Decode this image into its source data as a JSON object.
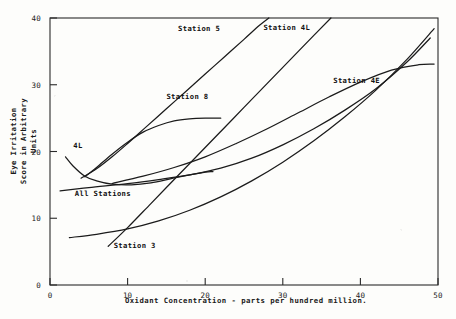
{
  "chart_data": {
    "type": "line",
    "title": "",
    "xlabel": "Oxidant Concentration - parts per hundred million.",
    "ylabel_line1": "Eye Irritation",
    "ylabel_line2": "Score in Arbitrary Units",
    "xlim": [
      0,
      50
    ],
    "ylim": [
      0,
      40
    ],
    "xticks": [
      0,
      10,
      20,
      30,
      40,
      50
    ],
    "yticks": [
      0,
      10,
      20,
      30,
      40
    ],
    "xtick_labels": [
      "0",
      "10",
      "20",
      "30",
      "40",
      "50"
    ],
    "ytick_labels": [
      "0",
      "10",
      "20",
      "30",
      "40"
    ],
    "grid": false,
    "legend": "inline-curve-labels",
    "series": [
      {
        "name": "4L",
        "label": "4L",
        "label_x": 3.0,
        "label_y": 20.5,
        "points": [
          [
            2.0,
            19.2
          ],
          [
            3.0,
            17.8
          ],
          [
            4.5,
            16.3
          ],
          [
            6.0,
            15.6
          ],
          [
            8.0,
            15.1
          ],
          [
            10.5,
            15.0
          ],
          [
            13.0,
            15.3
          ],
          [
            15.5,
            15.9
          ],
          [
            17.5,
            16.4
          ],
          [
            19.5,
            16.8
          ],
          [
            21.0,
            17.0
          ]
        ]
      },
      {
        "name": "All Stations",
        "label": "All Stations",
        "label_x": 3.2,
        "label_y": 13.4,
        "points": [
          [
            1.3,
            14.1
          ],
          [
            5.0,
            14.6
          ],
          [
            10.0,
            15.2
          ],
          [
            14.0,
            15.8
          ],
          [
            18.0,
            16.5
          ],
          [
            22.0,
            17.5
          ],
          [
            26.0,
            19.0
          ],
          [
            30.0,
            21.0
          ],
          [
            34.0,
            23.4
          ],
          [
            38.0,
            26.2
          ],
          [
            42.0,
            29.4
          ],
          [
            46.0,
            33.4
          ],
          [
            49.0,
            37.0
          ]
        ]
      },
      {
        "name": "Station 5",
        "label": "Station 5",
        "label_x": 16.5,
        "label_y": 38.0,
        "points": [
          [
            4.0,
            16.0
          ],
          [
            6.0,
            17.4
          ],
          [
            8.0,
            19.2
          ],
          [
            10.0,
            21.2
          ],
          [
            12.5,
            23.8
          ],
          [
            15.0,
            26.4
          ],
          [
            17.5,
            29.0
          ],
          [
            20.0,
            31.6
          ],
          [
            22.5,
            34.2
          ],
          [
            25.0,
            36.8
          ],
          [
            27.0,
            38.9
          ],
          [
            28.2,
            40.0
          ]
        ]
      },
      {
        "name": "Station 8",
        "label": "Station 8",
        "label_x": 15.0,
        "label_y": 27.8,
        "points": [
          [
            4.5,
            16.2
          ],
          [
            6.0,
            17.6
          ],
          [
            8.0,
            19.6
          ],
          [
            10.0,
            21.4
          ],
          [
            12.0,
            22.9
          ],
          [
            14.0,
            23.9
          ],
          [
            16.0,
            24.6
          ],
          [
            18.0,
            24.9
          ],
          [
            20.0,
            25.0
          ],
          [
            22.0,
            25.0
          ]
        ]
      },
      {
        "name": "Station 4L",
        "label": "Station 4L",
        "label_x": 27.5,
        "label_y": 38.2,
        "points": [
          [
            7.5,
            5.8
          ],
          [
            10.0,
            8.6
          ],
          [
            13.0,
            12.2
          ],
          [
            16.0,
            15.8
          ],
          [
            19.0,
            19.4
          ],
          [
            22.0,
            23.0
          ],
          [
            25.0,
            26.6
          ],
          [
            28.0,
            30.2
          ],
          [
            31.0,
            33.8
          ],
          [
            34.0,
            37.4
          ],
          [
            36.2,
            40.0
          ]
        ]
      },
      {
        "name": "Station 4E",
        "label": "Station 4E",
        "label_x": 36.5,
        "label_y": 30.2,
        "points": [
          [
            8.0,
            15.2
          ],
          [
            12.0,
            16.3
          ],
          [
            16.0,
            17.6
          ],
          [
            20.0,
            19.2
          ],
          [
            24.0,
            21.2
          ],
          [
            28.0,
            23.4
          ],
          [
            32.0,
            25.8
          ],
          [
            36.0,
            28.2
          ],
          [
            40.0,
            30.4
          ],
          [
            44.0,
            32.2
          ],
          [
            47.5,
            33.0
          ],
          [
            49.5,
            33.1
          ]
        ]
      },
      {
        "name": "Station 3",
        "label": "Station 3",
        "label_x": 8.2,
        "label_y": 5.6,
        "points": [
          [
            2.5,
            7.1
          ],
          [
            6.0,
            7.6
          ],
          [
            10.0,
            8.4
          ],
          [
            14.0,
            9.6
          ],
          [
            18.0,
            11.2
          ],
          [
            22.0,
            13.2
          ],
          [
            26.0,
            15.6
          ],
          [
            30.0,
            18.4
          ],
          [
            34.0,
            21.6
          ],
          [
            38.0,
            25.2
          ],
          [
            42.0,
            29.2
          ],
          [
            46.0,
            33.8
          ],
          [
            49.5,
            38.4
          ]
        ]
      }
    ]
  }
}
